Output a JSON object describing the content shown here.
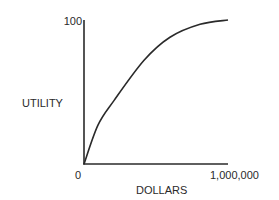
{
  "chart_data": {
    "type": "line",
    "title": "",
    "xlabel": "DOLLARS",
    "ylabel": "UTILITY",
    "x_tick_labels": [
      "0",
      "1,000,000"
    ],
    "y_tick_labels": [
      "100"
    ],
    "xlim": [
      0,
      1000000
    ],
    "ylim": [
      0,
      100
    ],
    "grid": false,
    "legend": null,
    "series": [
      {
        "name": "Utility curve",
        "x": [
          0,
          97000,
          208000,
          417000,
          597000,
          806000,
          1000000
        ],
        "y": [
          0,
          27,
          44,
          72,
          88,
          97,
          100
        ]
      }
    ],
    "colors": {
      "line": "#2a2a2a",
      "axis": "#2a2a2a",
      "background": "#ffffff"
    }
  },
  "labels": {
    "y_top": "100",
    "y_axis": "UTILITY",
    "x_origin": "0",
    "x_max": "1,000,000",
    "x_axis": "DOLLARS"
  }
}
